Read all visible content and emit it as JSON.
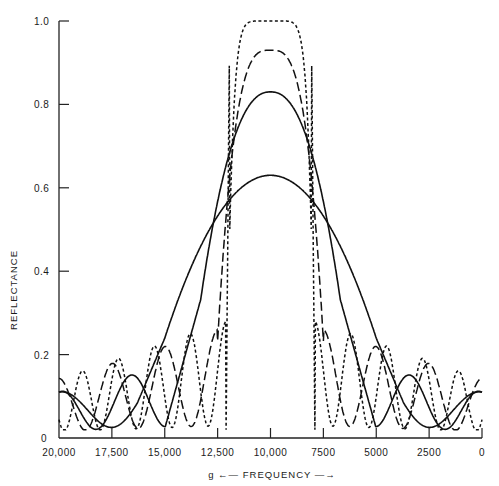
{
  "chart_data": {
    "type": "line",
    "title": "",
    "xlabel": "FREQUENCY",
    "xlabel_prefix": "g",
    "xlabel_arrow_left": "←",
    "xlabel_arrow_right": "→",
    "ylabel": "REFLECTANCE",
    "xlim": [
      20000,
      0
    ],
    "ylim": [
      0,
      1.0
    ],
    "x_reversed": true,
    "x_ticks": [
      20000,
      17500,
      15000,
      12500,
      10000,
      7500,
      5000,
      2500,
      0
    ],
    "x_tick_labels": [
      "20,000",
      "17,500",
      "15,000",
      "12,500",
      "10,000",
      "7500",
      "5000",
      "2500",
      "0"
    ],
    "y_ticks": [
      0,
      0.2,
      0.4,
      0.6,
      0.8,
      1.0
    ],
    "y_tick_labels": [
      "0",
      "0.2",
      "0.4",
      "0.6",
      "0.8",
      "1.0"
    ],
    "grid": false,
    "legend": null,
    "series": [
      {
        "name": "solid (low peak)",
        "style": "solid",
        "peak": 0.63,
        "center": 10000,
        "halfwidth": 5000,
        "ripple_period": 5000,
        "ripple_amp": 0.16
      },
      {
        "name": "solid (0.83 peak)",
        "style": "solid",
        "peak": 0.83,
        "center": 10000,
        "halfwidth": 3300,
        "ripple_period": 3300,
        "ripple_amp": 0.19
      },
      {
        "name": "long-dash (0.93 peak)",
        "style": "dashed",
        "peak": 0.93,
        "center": 10000,
        "halfwidth": 2500,
        "ripple_period": 2500,
        "ripple_amp": 0.26
      },
      {
        "name": "short-dash (1.0 peak)",
        "style": "dotted",
        "peak": 1.0,
        "center": 10000,
        "halfwidth": 2100,
        "ripple_period": 1700,
        "ripple_amp": 0.28
      }
    ]
  }
}
